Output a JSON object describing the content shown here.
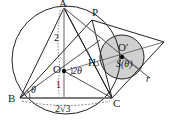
{
  "diagram": {
    "points": {
      "A": "A",
      "B": "B",
      "C": "C",
      "O": "O",
      "P": "P",
      "H": "H",
      "O_prime": "O′"
    },
    "labels": {
      "side_AO": "2",
      "side_OM": "1",
      "base_BC": "2√3",
      "angle_B": "θ",
      "angle_O": "2θ",
      "area": "S(θ)",
      "radius": "r"
    },
    "colors": {
      "stroke": "#222222",
      "dashed": "#555555",
      "shade": "#d0d0d0",
      "accent_line": "#888888"
    }
  }
}
